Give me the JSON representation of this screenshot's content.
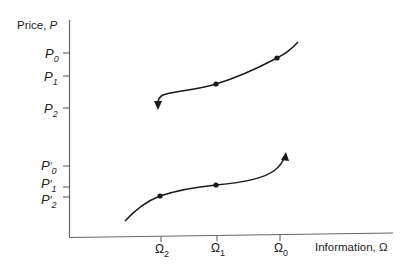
{
  "figure": {
    "y_axis_label_prefix": "Price, ",
    "y_axis_label_var": "P",
    "x_axis_label": "Information, Ω",
    "y_ticks": [
      {
        "main": "P",
        "prime": "",
        "sub": "0",
        "y": 53
      },
      {
        "main": "P",
        "prime": "",
        "sub": "1",
        "y": 76
      },
      {
        "main": "P",
        "prime": "",
        "sub": "2",
        "y": 108
      },
      {
        "main": "P",
        "prime": "′",
        "sub": "0",
        "y": 166
      },
      {
        "main": "P",
        "prime": "′",
        "sub": "1",
        "y": 187
      },
      {
        "main": "P",
        "prime": "′",
        "sub": "2",
        "y": 197
      }
    ],
    "x_ticks": [
      {
        "main": "Ω",
        "sub": "2",
        "x": 161
      },
      {
        "main": "Ω",
        "sub": "1",
        "x": 217
      },
      {
        "main": "Ω",
        "sub": "0",
        "x": 280
      }
    ],
    "curves": [
      {
        "name": "upper-curve",
        "direction": "decreasing information, arrow points down-left",
        "points": [
          [
            "Ω0",
            "P0"
          ],
          [
            "Ω1",
            "P1"
          ]
        ],
        "arrow_end": "P2 level"
      },
      {
        "name": "lower-curve",
        "direction": "increasing information, arrow points up-right",
        "points": [
          [
            "Ω2",
            "P'2"
          ],
          [
            "Ω1",
            "P'1"
          ]
        ],
        "arrow_end": "P'0 level"
      }
    ],
    "colors": {
      "ink": "#1a1a1a",
      "axis": "#555555"
    }
  }
}
